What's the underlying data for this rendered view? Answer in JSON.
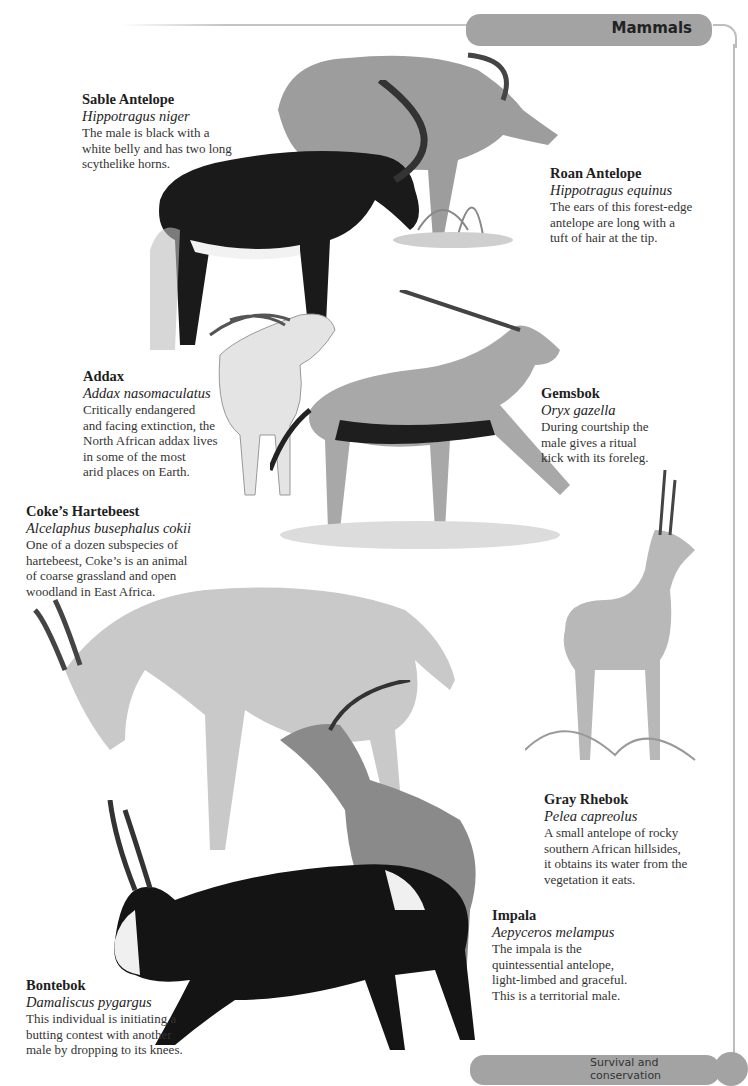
{
  "header": {
    "section_title": "Mammals"
  },
  "footer": {
    "text": "Survival and conservation"
  },
  "species": [
    {
      "common": "Sable Antelope",
      "latin": "Hippotragus niger",
      "description": "The male is black with a\nwhite belly and has two long\nscythelike horns."
    },
    {
      "common": "Roan Antelope",
      "latin": "Hippotragus equinus",
      "description": "The ears of this forest-edge\nantelope are long with a\ntuft of hair at the tip."
    },
    {
      "common": "Addax",
      "latin": "Addax nasomaculatus",
      "description": "Critically endangered\nand facing extinction, the\nNorth African addax lives\nin some of the most\narid places on Earth."
    },
    {
      "common": "Gemsbok",
      "latin": "Oryx gazella",
      "description": "During courtship the\nmale gives a ritual\nkick with its foreleg."
    },
    {
      "common": "Coke’s Hartebeest",
      "latin": "Alcelaphus busephalus cokii",
      "description": "One of a dozen subspecies of\nhartebeest, Coke’s is an animal\nof coarse grassland and open\nwoodland in East Africa."
    },
    {
      "common": "Gray Rhebok",
      "latin": "Pelea capreolus",
      "description": "A small antelope of rocky\nsouthern African hillsides,\nit obtains its water from the\nvegetation it eats."
    },
    {
      "common": "Impala",
      "latin": "Aepyceros melampus",
      "description": "The impala is the\nquintessential antelope,\nlight-limbed and graceful.\nThis is a territorial male."
    },
    {
      "common": "Bontebok",
      "latin": "Damaliscus pygargus",
      "description": "This individual is initiating a\nbutting contest with another\nmale by dropping to its knees."
    }
  ],
  "colors": {
    "tab_gray": "#a3a3a3",
    "frame_line": "#bdbdbd",
    "text": "#333333"
  }
}
